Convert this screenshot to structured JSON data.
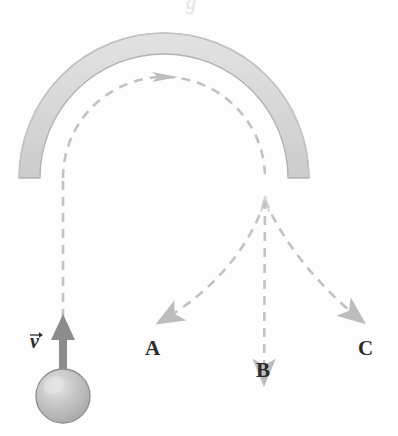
{
  "figure": {
    "background_color": "#fdfdfd"
  },
  "tube": {
    "name": "semicircular-tube",
    "shape": "half-annulus",
    "center_x": 164,
    "center_y": 178,
    "inner_radius": 124,
    "outer_radius": 145,
    "fill_color": "#d9d9d9",
    "stroke_color": "#b0b0b0",
    "start_angle_deg": 180,
    "end_angle_deg": 0,
    "left_end_x": 26,
    "right_end_x": 302,
    "end_y": 178
  },
  "ball": {
    "name": "ball",
    "center_x": 63,
    "center_y": 396,
    "radius": 27,
    "fill_color": "#b9b9b9",
    "highlight_color": "#e3e3e3",
    "stroke_color": "#8e8e8e"
  },
  "velocity_vector": {
    "name": "velocity-arrow",
    "label": "v",
    "label_x": 30,
    "label_y": 330,
    "direction": "up",
    "tail_x": 63,
    "tail_y": 380,
    "tip_x": 63,
    "tip_y": 318,
    "color": "#8c8c8c"
  },
  "paths": {
    "dash_color": "#c2c2c2",
    "dash_pattern": "9 7",
    "stroke_width": 2.6,
    "entry": {
      "name": "entry-path",
      "description": "vertical dashed line from ball up into tube",
      "from_x": 63,
      "from_y": 318,
      "to_x": 63,
      "to_y": 178
    },
    "inside_tube": {
      "name": "in-tube-path",
      "description": "dashed arc following the inside of the tube",
      "radius": 132,
      "direction_arrow": "clockwise",
      "arrow_x": 164,
      "arrow_y": 46
    },
    "exit_point": {
      "x": 265,
      "y": 200
    }
  },
  "trajectories": [
    {
      "id": "A",
      "name": "trajectory-a",
      "label": "A",
      "label_x": 145,
      "label_y": 336,
      "arrow_tip_x": 152,
      "arrow_tip_y": 327,
      "description": "curves down and to the left"
    },
    {
      "id": "B",
      "name": "trajectory-b",
      "label": "B",
      "label_x": 256,
      "label_y": 358,
      "arrow_tip_x": 263,
      "arrow_tip_y": 390,
      "description": "straight down, vertical"
    },
    {
      "id": "C",
      "name": "trajectory-c",
      "label": "C",
      "label_x": 358,
      "label_y": 336,
      "arrow_tip_x": 368,
      "arrow_tip_y": 327,
      "description": "curves down and to the right"
    }
  ],
  "top_bleed_glyph": "g"
}
